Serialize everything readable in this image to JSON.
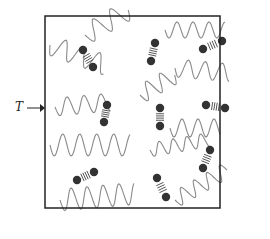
{
  "diagram": {
    "label": "T",
    "box": {
      "x": 45,
      "y": 16,
      "w": 175,
      "h": 192
    },
    "colors": {
      "wave": "#8a8a8a",
      "molecule": "#333333",
      "spring": "#555555",
      "border": "#222222"
    },
    "molecules": [
      {
        "x1": 83,
        "y1": 50,
        "x2": 93,
        "y2": 67
      },
      {
        "x1": 155,
        "y1": 43,
        "x2": 151,
        "y2": 61
      },
      {
        "x1": 203,
        "y1": 49,
        "x2": 222,
        "y2": 41
      },
      {
        "x1": 107,
        "y1": 105,
        "x2": 104,
        "y2": 122
      },
      {
        "x1": 160,
        "y1": 108,
        "x2": 160,
        "y2": 126
      },
      {
        "x1": 206,
        "y1": 105,
        "x2": 225,
        "y2": 108
      },
      {
        "x1": 210,
        "y1": 150,
        "x2": 203,
        "y2": 168
      },
      {
        "x1": 77,
        "y1": 180,
        "x2": 94,
        "y2": 172
      },
      {
        "x1": 157,
        "y1": 178,
        "x2": 166,
        "y2": 197
      }
    ],
    "waves": [
      {
        "x": 50,
        "y": 45,
        "len": 60,
        "amp": 10,
        "period": 18,
        "angle": 20
      },
      {
        "x": 85,
        "y": 35,
        "len": 50,
        "amp": 10,
        "period": 20,
        "angle": -30
      },
      {
        "x": 165,
        "y": 30,
        "len": 60,
        "amp": 8,
        "period": 16,
        "angle": 0
      },
      {
        "x": 175,
        "y": 68,
        "len": 55,
        "amp": 9,
        "period": 17,
        "angle": 5
      },
      {
        "x": 55,
        "y": 107,
        "len": 55,
        "amp": 9,
        "period": 17,
        "angle": -5
      },
      {
        "x": 140,
        "y": 95,
        "len": 40,
        "amp": 9,
        "period": 16,
        "angle": -30
      },
      {
        "x": 170,
        "y": 128,
        "len": 50,
        "amp": 9,
        "period": 16,
        "angle": 0
      },
      {
        "x": 50,
        "y": 145,
        "len": 80,
        "amp": 11,
        "period": 17,
        "angle": 0
      },
      {
        "x": 150,
        "y": 150,
        "len": 60,
        "amp": 7,
        "period": 14,
        "angle": -10
      },
      {
        "x": 175,
        "y": 200,
        "len": 60,
        "amp": 8,
        "period": 15,
        "angle": -30
      },
      {
        "x": 60,
        "y": 200,
        "len": 75,
        "amp": 11,
        "period": 16,
        "angle": -5
      }
    ]
  }
}
